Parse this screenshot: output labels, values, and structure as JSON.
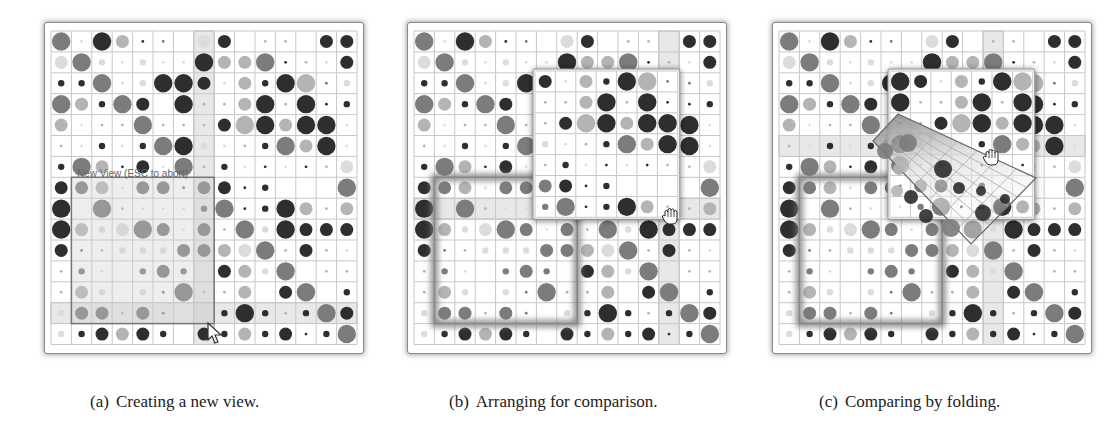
{
  "figure": {
    "panels": [
      {
        "id": "a",
        "label": "(a)",
        "caption": "Creating a new view.",
        "new_view_label": "New View (ESC to abort)"
      },
      {
        "id": "b",
        "label": "(b)",
        "caption": "Arranging for comparison."
      },
      {
        "id": "c",
        "label": "(c)",
        "caption": "Comparing by folding."
      }
    ],
    "matrix": {
      "rows": 15,
      "cols": 15,
      "size_scale": [
        "none",
        "tiny",
        "small",
        "medium",
        "large"
      ],
      "shade_colors": {
        "d": "#2e2e2e",
        "m": "#7c7c7c",
        "l": "#b4b4b4",
        "v": "#dcdcdc"
      },
      "cells": [
        [
          "4m",
          "1v",
          "4d",
          "3l",
          "1d",
          "1m",
          "0",
          "3v",
          "3d",
          "0",
          "1l",
          "1l",
          "0",
          "3d",
          "3d"
        ],
        [
          "3v",
          "4m",
          "2v",
          "1v",
          "2v",
          "1v",
          "1v",
          "4d",
          "3l",
          "3l",
          "4m",
          "1d",
          "1l",
          "1v",
          "3d"
        ],
        [
          "2d",
          "2d",
          "4m",
          "1v",
          "2v",
          "4d",
          "4d",
          "3d",
          "1v",
          "3l",
          "2d",
          "4d",
          "4l",
          "1m",
          "2v"
        ],
        [
          "4m",
          "3l",
          "2d",
          "4m",
          "3d",
          "0",
          "4d",
          "1l",
          "1l",
          "3l",
          "4d",
          "1l",
          "4d",
          "1d",
          "2d"
        ],
        [
          "3l",
          "1v",
          "1l",
          "1l",
          "4m",
          "1l",
          "1l",
          "1l",
          "3d",
          "4l",
          "4d",
          "3l",
          "4d",
          "4d",
          "1v"
        ],
        [
          "1l",
          "1v",
          "2d",
          "1v",
          "2d",
          "4m",
          "4d",
          "2v",
          "1v",
          "1l",
          "2d",
          "4m",
          "3l",
          "4d",
          "1v"
        ],
        [
          "2d",
          "4m",
          "3l",
          "1d",
          "3d",
          "1v",
          "4m",
          "1l",
          "2d",
          "1v",
          "1d",
          "1v",
          "1d",
          "1l",
          "3v"
        ],
        [
          "3d",
          "3m",
          "3l",
          "1v",
          "3m",
          "3m",
          "1m",
          "3m",
          "3d",
          "1d",
          "2d",
          "0",
          "0",
          "0",
          "4m"
        ],
        [
          "4d",
          "0",
          "4m",
          "1l",
          "1v",
          "1v",
          "1v",
          "2m",
          "4m",
          "1d",
          "2d",
          "4d",
          "3l",
          "1l",
          "3l"
        ],
        [
          "4d",
          "3l",
          "2v",
          "3v",
          "4m",
          "3m",
          "1v",
          "3m",
          "1l",
          "4m",
          "2v",
          "4d",
          "3d",
          "3d",
          "3d"
        ],
        [
          "3d",
          "1m",
          "1l",
          "2v",
          "2v",
          "2v",
          "3m",
          "3m",
          "3l",
          "3v",
          "4m",
          "1l",
          "3d",
          "1l",
          "1v"
        ],
        [
          "1l",
          "2m",
          "1v",
          "0",
          "2m",
          "3m",
          "2m",
          "0",
          "3d",
          "3l",
          "2v",
          "4m",
          "0",
          "1l",
          "1l"
        ],
        [
          "1l",
          "3l",
          "2v",
          "0",
          "2v",
          "1m",
          "4m",
          "1l",
          "1l",
          "3l",
          "0",
          "3d",
          "4m",
          "0",
          "2d"
        ],
        [
          "2v",
          "3m",
          "3m",
          "1l",
          "3m",
          "1m",
          "0",
          "2v",
          "2d",
          "4d",
          "2d",
          "1l",
          "2d",
          "4m",
          "3d"
        ],
        [
          "2v",
          "2d",
          "3d",
          "3l",
          "3d",
          "2d",
          "0",
          "3d",
          "2d",
          "3l",
          "2d",
          "3d",
          "1d",
          "2d",
          "4m"
        ]
      ]
    },
    "panel_a": {
      "highlight_col": 7,
      "highlight_row": 13,
      "selection": {
        "col": 1,
        "row": 7,
        "cols": 7,
        "rows": 7
      }
    },
    "panel_b": {
      "highlight_col": 12,
      "highlight_row": 8,
      "anchored_view": {
        "col": 1,
        "row": 7,
        "cols": 7,
        "rows": 7
      },
      "floating_view": {
        "src_col": 7,
        "src_row": 2,
        "cols": 7,
        "rows": 7,
        "x": 125,
        "y": 46
      }
    },
    "panel_c": {
      "highlight_col": 10,
      "highlight_row": 5,
      "anchored_view": {
        "col": 1,
        "row": 7,
        "cols": 7,
        "rows": 7
      },
      "floating_view": {
        "src_col": 6,
        "src_row": 2,
        "cols": 7,
        "rows": 7,
        "x": 115,
        "y": 46
      },
      "fold_polygon": [
        [
          100,
          118
        ],
        [
          125,
          91
        ],
        [
          263,
          155
        ],
        [
          198,
          221
        ]
      ]
    },
    "icons": {
      "pointer": "arrow-cursor-icon",
      "drag": "hand-grab-icon"
    }
  }
}
